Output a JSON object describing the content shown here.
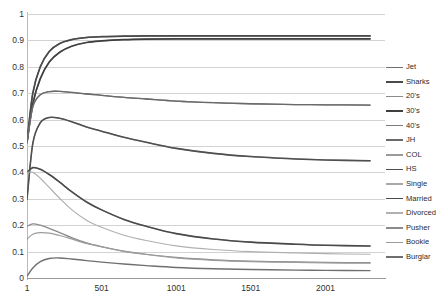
{
  "chart_data": {
    "type": "line",
    "title": "",
    "subtitle": "",
    "xlabel": "",
    "ylabel": "",
    "xlim": [
      1,
      2400
    ],
    "ylim": [
      0,
      1
    ],
    "grid": true,
    "legend_position": "right",
    "y_ticks": [
      "0",
      "0.1",
      "0.2",
      "0.3",
      "0.4",
      "0.5",
      "0.6",
      "0.7",
      "0.8",
      "0.9",
      "1"
    ],
    "y_tick_values": [
      0,
      0.1,
      0.2,
      0.3,
      0.4,
      0.5,
      0.6,
      0.7,
      0.8,
      0.9,
      1
    ],
    "x_ticks": [
      "1",
      "501",
      "1001",
      "1501",
      "2001"
    ],
    "x_tick_values": [
      1,
      501,
      1001,
      1501,
      2001
    ],
    "x": [
      1,
      40,
      90,
      150,
      220,
      300,
      400,
      501,
      650,
      800,
      1001,
      1250,
      1501,
      1800,
      2001,
      2300
    ],
    "series": [
      {
        "name": "Jet",
        "color": "#6e6e6e",
        "width": 1.3,
        "values": [
          0.515,
          0.7,
          0.8,
          0.858,
          0.888,
          0.903,
          0.911,
          0.914,
          0.916,
          0.917,
          0.917,
          0.917,
          0.917,
          0.917,
          0.917,
          0.917
        ]
      },
      {
        "name": "Sharks",
        "color": "#4a4a4a",
        "width": 1.7,
        "values": [
          0.515,
          0.7,
          0.8,
          0.858,
          0.888,
          0.903,
          0.911,
          0.914,
          0.916,
          0.917,
          0.917,
          0.917,
          0.917,
          0.917,
          0.917,
          0.917
        ]
      },
      {
        "name": "20's",
        "color": "#8a8a8a",
        "width": 1.2,
        "values": [
          0.513,
          0.66,
          0.755,
          0.818,
          0.855,
          0.878,
          0.892,
          0.898,
          0.903,
          0.905,
          0.906,
          0.906,
          0.906,
          0.906,
          0.906,
          0.906
        ]
      },
      {
        "name": "30's",
        "color": "#3f3f3f",
        "width": 1.7,
        "values": [
          0.513,
          0.66,
          0.755,
          0.818,
          0.855,
          0.878,
          0.892,
          0.898,
          0.903,
          0.905,
          0.906,
          0.906,
          0.906,
          0.906,
          0.906,
          0.906
        ]
      },
      {
        "name": "40's",
        "color": "#7d7d7d",
        "width": 1.3,
        "values": [
          0.513,
          0.648,
          0.694,
          0.706,
          0.707,
          0.703,
          0.697,
          0.692,
          0.684,
          0.678,
          0.67,
          0.664,
          0.66,
          0.657,
          0.656,
          0.655
        ]
      },
      {
        "name": "JH",
        "color": "#6a6a6a",
        "width": 1.3,
        "values": [
          0.513,
          0.648,
          0.694,
          0.706,
          0.707,
          0.703,
          0.697,
          0.692,
          0.684,
          0.678,
          0.67,
          0.664,
          0.66,
          0.657,
          0.656,
          0.655
        ]
      },
      {
        "name": "COL",
        "color": "#9a9a9a",
        "width": 1.2,
        "values": [
          0.298,
          0.51,
          0.588,
          0.608,
          0.605,
          0.592,
          0.572,
          0.556,
          0.533,
          0.514,
          0.491,
          0.472,
          0.46,
          0.451,
          0.447,
          0.444
        ]
      },
      {
        "name": "HS",
        "color": "#4f4f4f",
        "width": 1.6,
        "values": [
          0.298,
          0.51,
          0.588,
          0.608,
          0.605,
          0.592,
          0.572,
          0.556,
          0.533,
          0.514,
          0.491,
          0.472,
          0.46,
          0.451,
          0.447,
          0.444
        ]
      },
      {
        "name": "Single",
        "color": "#a8a8a8",
        "width": 1.2,
        "values": [
          0.4,
          0.418,
          0.412,
          0.392,
          0.363,
          0.327,
          0.288,
          0.258,
          0.222,
          0.196,
          0.168,
          0.148,
          0.136,
          0.128,
          0.124,
          0.121
        ]
      },
      {
        "name": "Married",
        "color": "#4a4a4a",
        "width": 1.6,
        "values": [
          0.4,
          0.418,
          0.412,
          0.392,
          0.363,
          0.327,
          0.288,
          0.258,
          0.222,
          0.196,
          0.168,
          0.148,
          0.136,
          0.128,
          0.124,
          0.121
        ]
      },
      {
        "name": "Divorced",
        "color": "#b0b0b0",
        "width": 1.2,
        "values": [
          0.4,
          0.4,
          0.378,
          0.343,
          0.302,
          0.259,
          0.219,
          0.192,
          0.162,
          0.142,
          0.122,
          0.108,
          0.1,
          0.095,
          0.092,
          0.09
        ]
      },
      {
        "name": "Pusher",
        "color": "#8b8b8b",
        "width": 1.2,
        "values": [
          0.196,
          0.205,
          0.2,
          0.188,
          0.172,
          0.153,
          0.133,
          0.119,
          0.102,
          0.09,
          0.078,
          0.069,
          0.064,
          0.061,
          0.059,
          0.058
        ]
      },
      {
        "name": "Bookie",
        "color": "#9c9c9c",
        "width": 1.2,
        "values": [
          0.147,
          0.166,
          0.172,
          0.17,
          0.161,
          0.148,
          0.131,
          0.118,
          0.101,
          0.089,
          0.076,
          0.067,
          0.062,
          0.059,
          0.057,
          0.056
        ]
      },
      {
        "name": "Burglar",
        "color": "#6f6f6f",
        "width": 1.4,
        "values": [
          0.007,
          0.038,
          0.062,
          0.074,
          0.076,
          0.072,
          0.066,
          0.06,
          0.053,
          0.047,
          0.04,
          0.035,
          0.032,
          0.03,
          0.029,
          0.028
        ]
      }
    ]
  },
  "legend": {
    "entries": [
      {
        "label": "Jet"
      },
      {
        "label": "Sharks"
      },
      {
        "label": "20's"
      },
      {
        "label": "30's"
      },
      {
        "label": "40's"
      },
      {
        "label": "JH"
      },
      {
        "label": "COL"
      },
      {
        "label": "HS"
      },
      {
        "label": "Single"
      },
      {
        "label": "Married"
      },
      {
        "label": "Divorced"
      },
      {
        "label": "Pusher"
      },
      {
        "label": "Bookie"
      },
      {
        "label": "Burglar"
      }
    ]
  }
}
